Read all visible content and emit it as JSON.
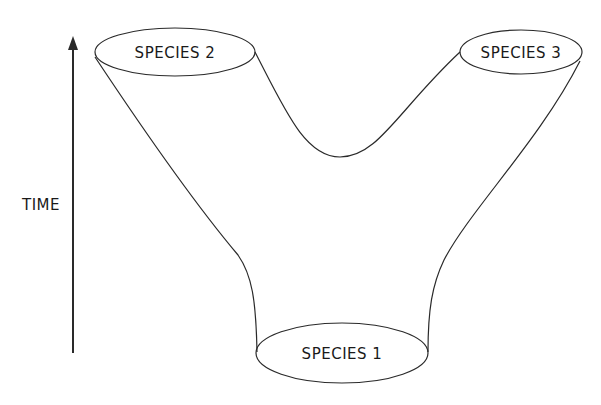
{
  "diagram": {
    "axis": {
      "label": "TIME",
      "direction": "up"
    },
    "nodes": [
      {
        "id": "species1",
        "label": "SPECIES 1",
        "position": "bottom-center"
      },
      {
        "id": "species2",
        "label": "SPECIES 2",
        "position": "top-left"
      },
      {
        "id": "species3",
        "label": "SPECIES 3",
        "position": "top-right"
      }
    ],
    "colors": {
      "line": "#2a2a2a",
      "background": "#ffffff"
    }
  }
}
